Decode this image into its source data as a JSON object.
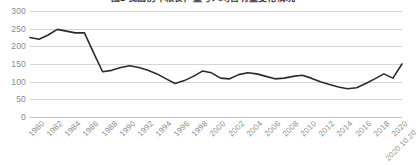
{
  "chart_data": {
    "type": "line",
    "title": "图1 我国历年粮食产量与人均占有量变化情况",
    "xlabel": "",
    "ylabel": "",
    "ylim": [
      0,
      300
    ],
    "ytick_step": 50,
    "yticks": [
      300,
      250,
      200,
      150,
      100,
      50,
      0
    ],
    "grid": true,
    "legend": "none",
    "line_color": "#2b2b2b",
    "gridline_color": "#d6d6d6",
    "tick_label_color": "#8f8f8f",
    "x": [
      "1980",
      "1981",
      "1982",
      "1983",
      "1984",
      "1985",
      "1986",
      "1987",
      "1988",
      "1989",
      "1990",
      "1991",
      "1992",
      "1993",
      "1994",
      "1995",
      "1996",
      "1997",
      "1998",
      "1999",
      "2000",
      "2001",
      "2002",
      "2003",
      "2004",
      "2005",
      "2006",
      "2007",
      "2008",
      "2009",
      "2010",
      "2011",
      "2012",
      "2013",
      "2014",
      "2015",
      "2016",
      "2017",
      "2018",
      "2019",
      "2020",
      "2020.10.20"
    ],
    "xticks": [
      "1980",
      "1982",
      "1984",
      "1986",
      "1988",
      "1990",
      "1992",
      "1994",
      "1996",
      "1998",
      "2000",
      "2002",
      "2004",
      "2006",
      "2008",
      "2010",
      "2012",
      "2014",
      "2016",
      "2018",
      "2020",
      "2020.10.20"
    ],
    "values": [
      225,
      220,
      232,
      248,
      243,
      238,
      238,
      182,
      128,
      132,
      140,
      145,
      140,
      132,
      122,
      108,
      95,
      103,
      115,
      130,
      125,
      110,
      108,
      120,
      125,
      122,
      115,
      108,
      110,
      115,
      118,
      110,
      100,
      92,
      85,
      80,
      83,
      95,
      108,
      122,
      110,
      150
    ],
    "series_name": "产量指数"
  }
}
